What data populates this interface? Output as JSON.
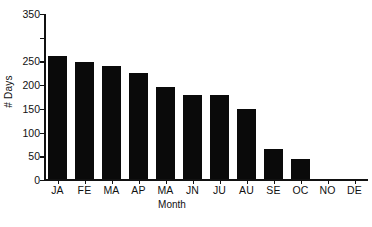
{
  "chart_data": {
    "type": "bar",
    "title": "",
    "xlabel": "Month",
    "ylabel": "# Days",
    "categories": [
      "JA",
      "FE",
      "MA",
      "AP",
      "MA",
      "JN",
      "JU",
      "AU",
      "SE",
      "OC",
      "NO",
      "DE"
    ],
    "values": [
      260,
      247,
      239,
      223,
      193,
      178,
      178,
      147,
      64,
      43,
      0,
      0
    ],
    "series": [
      {
        "name": "# Days",
        "values": [
          260,
          247,
          239,
          223,
          193,
          178,
          178,
          147,
          64,
          43,
          0,
          0
        ]
      }
    ],
    "ylim": [
      0,
      350
    ],
    "y_ticks": [
      0,
      50,
      100,
      150,
      200,
      250,
      300,
      350
    ],
    "y_tick_labels": [
      "0",
      "50",
      "100",
      "150",
      "200",
      "250",
      "",
      "350"
    ],
    "grid": false,
    "legend": false,
    "bar_color": "#0a0a0a",
    "axis_color": "#111111",
    "spines": [
      "left",
      "bottom"
    ]
  }
}
